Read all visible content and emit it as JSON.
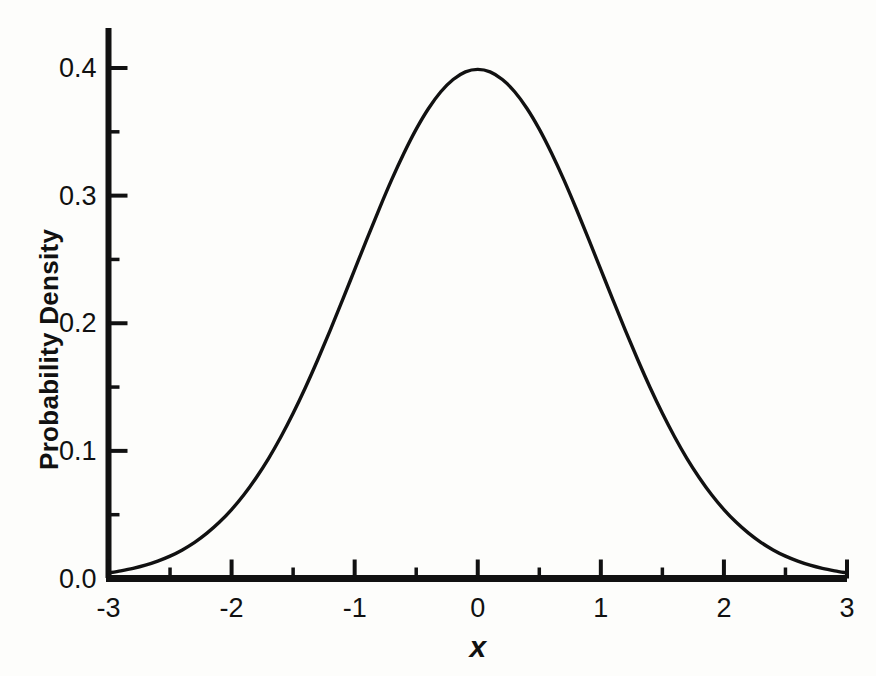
{
  "chart_data": {
    "type": "line",
    "title": "",
    "subtitle": "",
    "xlabel": "x",
    "ylabel": "Probability Density",
    "xlim": [
      -3,
      3
    ],
    "ylim": [
      0.0,
      0.42
    ],
    "grid": false,
    "legend": "none",
    "x_major_ticks": [
      -3,
      -2,
      -1,
      0,
      1,
      2,
      3
    ],
    "x_minor_ticks": [
      -2.5,
      -1.5,
      -0.5,
      0.5,
      1.5,
      2.5
    ],
    "x_tick_labels": [
      "-3",
      "-2",
      "-1",
      "0",
      "1",
      "2",
      "3"
    ],
    "y_major_ticks": [
      0.0,
      0.1,
      0.2,
      0.3,
      0.4
    ],
    "y_minor_ticks": [
      0.05,
      0.15,
      0.25,
      0.35
    ],
    "y_tick_labels": [
      "0.0",
      "0.1",
      "0.2",
      "0.3",
      "0.4"
    ],
    "tick_direction": "in",
    "series": [
      {
        "name": "Standard normal probability density",
        "color": "#111111",
        "x": [
          -3.0,
          -2.9,
          -2.8,
          -2.7,
          -2.6,
          -2.5,
          -2.4,
          -2.3,
          -2.2,
          -2.1,
          -2.0,
          -1.9,
          -1.8,
          -1.7,
          -1.6,
          -1.5,
          -1.4,
          -1.3,
          -1.2,
          -1.1,
          -1.0,
          -0.9,
          -0.8,
          -0.7,
          -0.6,
          -0.5,
          -0.4,
          -0.3,
          -0.2,
          -0.1,
          0.0,
          0.1,
          0.2,
          0.3,
          0.4,
          0.5,
          0.6,
          0.7,
          0.8,
          0.9,
          1.0,
          1.1,
          1.2,
          1.3,
          1.4,
          1.5,
          1.6,
          1.7,
          1.8,
          1.9,
          2.0,
          2.1,
          2.2,
          2.3,
          2.4,
          2.5,
          2.6,
          2.7,
          2.8,
          2.9,
          3.0
        ],
        "y": [
          0.0044,
          0.006,
          0.0079,
          0.0104,
          0.0136,
          0.0175,
          0.0224,
          0.0283,
          0.0355,
          0.044,
          0.054,
          0.0656,
          0.079,
          0.094,
          0.1109,
          0.1295,
          0.1497,
          0.1714,
          0.1942,
          0.2179,
          0.242,
          0.2661,
          0.2897,
          0.3123,
          0.3332,
          0.3521,
          0.3683,
          0.3814,
          0.391,
          0.397,
          0.3989,
          0.397,
          0.391,
          0.3814,
          0.3683,
          0.3521,
          0.3332,
          0.3123,
          0.2897,
          0.2661,
          0.242,
          0.2179,
          0.1942,
          0.1714,
          0.1497,
          0.1295,
          0.1109,
          0.094,
          0.079,
          0.0656,
          0.054,
          0.044,
          0.0355,
          0.0283,
          0.0224,
          0.0175,
          0.0136,
          0.0104,
          0.0079,
          0.006,
          0.0044
        ],
        "peak_x": 0.0,
        "peak_y": 0.3989
      }
    ]
  },
  "style": {
    "axis_color": "#111111",
    "curve_color": "#111111",
    "background": "#fdfdfb"
  }
}
